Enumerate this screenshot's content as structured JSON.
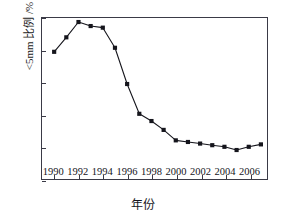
{
  "chart_data": {
    "type": "line",
    "title": "",
    "subtitle": "",
    "xlabel": "年份",
    "ylabel": "<5mm 比例 /%",
    "xlim": [
      1989,
      2007.5
    ],
    "ylim": [
      0,
      10
    ],
    "grid": false,
    "legend": null,
    "marker": "filled-square",
    "line_color": "#15151c",
    "marker_color": "#15151c",
    "x_tick_labels": [
      "1990",
      "1992",
      "1994",
      "1996",
      "1998",
      "2000",
      "2002",
      "2004",
      "2006"
    ],
    "x_ticks": [
      1990,
      1992,
      1994,
      1996,
      1998,
      2000,
      2002,
      2004,
      2006
    ],
    "y_tick_labels": [
      "0",
      "2",
      "4",
      "6",
      "8",
      "10"
    ],
    "y_ticks": [
      0,
      2,
      4,
      6,
      8,
      10
    ],
    "x": [
      1990,
      1991,
      1992,
      1993,
      1994,
      1995,
      1996,
      1997,
      1998,
      1999,
      2000,
      2001,
      2002,
      2003,
      2004,
      2005,
      2006,
      2007
    ],
    "values": [
      7.9,
      8.8,
      9.75,
      9.5,
      9.4,
      8.15,
      5.9,
      4.05,
      3.6,
      3.05,
      2.4,
      2.3,
      2.2,
      2.1,
      2.0,
      1.8,
      2.0,
      2.15
    ],
    "series": [
      {
        "name": "<5mm 比例",
        "values": [
          7.9,
          8.8,
          9.75,
          9.5,
          9.4,
          8.15,
          5.9,
          4.05,
          3.6,
          3.05,
          2.4,
          2.3,
          2.2,
          2.1,
          2.0,
          1.8,
          2.0,
          2.15
        ]
      }
    ]
  }
}
